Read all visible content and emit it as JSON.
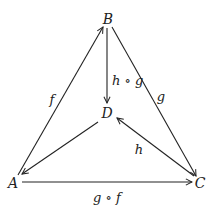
{
  "diagram": {
    "type": "commutative-diagram",
    "nodes": [
      {
        "id": "B",
        "label": "B",
        "x": 108,
        "y": 22
      },
      {
        "id": "D",
        "label": "D",
        "x": 107,
        "y": 117
      },
      {
        "id": "A",
        "label": "A",
        "x": 13,
        "y": 186
      },
      {
        "id": "C",
        "label": "C",
        "x": 200,
        "y": 186
      }
    ],
    "edges": [
      {
        "from": "A",
        "to": "B",
        "label": "f"
      },
      {
        "from": "B",
        "to": "C",
        "label": "g"
      },
      {
        "from": "B",
        "to": "D",
        "label": "h ∘ g"
      },
      {
        "from": "C",
        "to": "D",
        "label": "h"
      },
      {
        "from": "D",
        "to": "A",
        "label": ""
      },
      {
        "from": "A",
        "to": "C",
        "label": "g ∘ f"
      }
    ],
    "labels": {
      "f": "f",
      "g": "g",
      "hg": "h ∘ g",
      "h": "h",
      "gf": "g ∘ f"
    }
  }
}
